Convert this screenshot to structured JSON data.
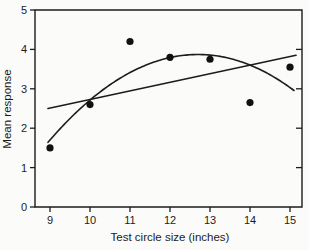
{
  "figure": {
    "background": "#fbfbfa",
    "ink": "#1c1c1c"
  },
  "chart_data": {
    "type": "scatter",
    "title": "",
    "xlabel": "Test circle size (inches)",
    "ylabel": "Mean response",
    "xlim": [
      8.6,
      15.35
    ],
    "ylim": [
      0,
      5
    ],
    "x_ticks": [
      9,
      10,
      11,
      12,
      13,
      14,
      15
    ],
    "y_ticks": [
      0,
      1,
      2,
      3,
      4,
      5
    ],
    "right_ticks_unlabeled": [
      1,
      2,
      3,
      4
    ],
    "grid": false,
    "legend": "none",
    "points": [
      {
        "x": 9,
        "y": 1.5
      },
      {
        "x": 10,
        "y": 2.6
      },
      {
        "x": 11,
        "y": 4.2
      },
      {
        "x": 12,
        "y": 3.8
      },
      {
        "x": 13,
        "y": 3.75
      },
      {
        "x": 14,
        "y": 2.65
      },
      {
        "x": 15,
        "y": 3.55
      }
    ],
    "fits": {
      "linear": {
        "x1": 8.95,
        "y1": 2.5,
        "x2": 15.15,
        "y2": 3.85
      },
      "quadratic": {
        "vertex_x": 12.7,
        "vertex_y": 3.87,
        "coeff": -0.1585,
        "x_start": 8.95,
        "x_end": 15.12
      }
    }
  }
}
